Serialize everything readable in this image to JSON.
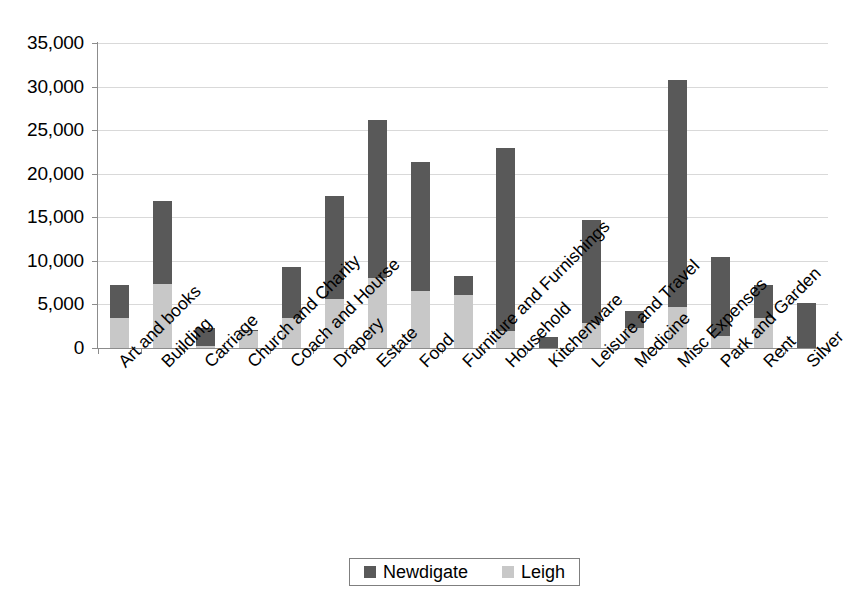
{
  "chart_data": {
    "type": "bar",
    "title": "",
    "subtitle": "",
    "xlabel": "",
    "ylabel": "",
    "stacked": true,
    "grid": true,
    "legend_position": "bottom",
    "ylim": [
      0,
      35000
    ],
    "ytick_values": [
      0,
      5000,
      10000,
      15000,
      20000,
      25000,
      30000,
      35000
    ],
    "ytick_labels": [
      "0",
      "5,000",
      "10,000",
      "15,000",
      "20,000",
      "25,000",
      "30,000",
      "35,000"
    ],
    "categories": [
      "Art and books",
      "Building",
      "Carriage",
      "Church and Charity",
      "Coach and Hourse",
      "Drapery",
      "Estate",
      "Food",
      "Furniture and Furnishings",
      "Household",
      "Kitchenware",
      "Leisure and Travel",
      "Medicine",
      "Misc Expenses",
      "Park and Garden",
      "Rent",
      "Silver"
    ],
    "series": [
      {
        "name": "Leigh",
        "color": "#c8c8c8",
        "values": [
          3500,
          7300,
          200,
          1900,
          3500,
          5600,
          8000,
          6600,
          6100,
          1900,
          0,
          2900,
          2300,
          4700,
          1400,
          3400,
          0
        ]
      },
      {
        "name": "Newdigate",
        "color": "#595959",
        "values": [
          3700,
          9600,
          2100,
          200,
          5800,
          11800,
          18200,
          14700,
          2200,
          21100,
          1300,
          11800,
          1900,
          26000,
          9100,
          3800,
          5200
        ]
      }
    ],
    "totals": [
      7200,
      16900,
      2300,
      2100,
      9300,
      17400,
      26200,
      21300,
      8300,
      23000,
      1300,
      14700,
      4200,
      30700,
      10500,
      7200,
      5200
    ]
  },
  "legend": {
    "items": [
      {
        "label": "Newdigate",
        "color": "#595959"
      },
      {
        "label": "Leigh",
        "color": "#c8c8c8"
      }
    ]
  }
}
